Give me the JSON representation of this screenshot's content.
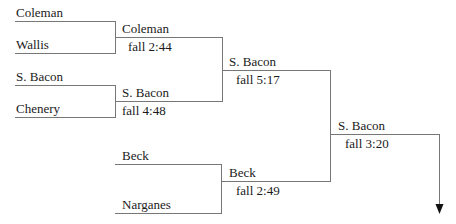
{
  "bracket": {
    "round1": [
      {
        "name": "Coleman"
      },
      {
        "name": "Wallis"
      },
      {
        "name": "S. Bacon"
      },
      {
        "name": "Chenery"
      },
      {
        "name": "Beck"
      },
      {
        "name": "Narganes"
      }
    ],
    "round2": [
      {
        "winner": "Coleman",
        "result": "fall 2:44"
      },
      {
        "winner": "S. Bacon",
        "result": "fall 4:48"
      },
      {
        "winner": "Beck",
        "result": "fall 2:49"
      }
    ],
    "round3": [
      {
        "winner": "S. Bacon",
        "result": "fall 5:17"
      }
    ],
    "final": {
      "winner": "S. Bacon",
      "result": "fall 3:20"
    }
  },
  "colors": {
    "line": "#777777",
    "text": "#1a1a1a",
    "arrow": "#111111"
  }
}
